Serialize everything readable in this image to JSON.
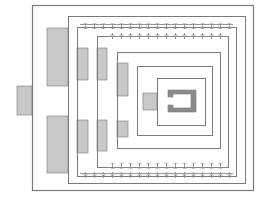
{
  "diagram": {
    "type": "architectural-floor-plan",
    "colors": {
      "background": "#ffffff",
      "line": "#7a7a7a",
      "fill_light": "#c8c8c8",
      "fill_dark": "#8a8a8a"
    },
    "enclosures": [
      {
        "x": 32,
        "y": 5,
        "w": 221,
        "h": 185
      },
      {
        "x": 68,
        "y": 16,
        "w": 177,
        "h": 167
      },
      {
        "x": 77,
        "y": 27,
        "w": 159,
        "h": 149,
        "crenellated": true
      },
      {
        "x": 97,
        "y": 36,
        "w": 131,
        "h": 131,
        "crenellated": true
      },
      {
        "x": 117,
        "y": 52,
        "w": 103,
        "h": 96
      },
      {
        "x": 137,
        "y": 66,
        "w": 75,
        "h": 69
      },
      {
        "x": 157,
        "y": 78,
        "w": 48,
        "h": 47
      }
    ],
    "gray_blocks": [
      {
        "x": 17,
        "y": 86,
        "w": 15,
        "h": 29
      },
      {
        "x": 47,
        "y": 28,
        "w": 21,
        "h": 58
      },
      {
        "x": 47,
        "y": 116,
        "w": 21,
        "h": 57
      },
      {
        "x": 77,
        "y": 48,
        "w": 11,
        "h": 32
      },
      {
        "x": 77,
        "y": 120,
        "w": 11,
        "h": 33
      },
      {
        "x": 97,
        "y": 48,
        "w": 10,
        "h": 32
      },
      {
        "x": 97,
        "y": 120,
        "w": 10,
        "h": 31
      },
      {
        "x": 117,
        "y": 63,
        "w": 11,
        "h": 33
      },
      {
        "x": 117,
        "y": 121,
        "w": 11,
        "h": 16
      },
      {
        "x": 143,
        "y": 93,
        "w": 14,
        "h": 17
      }
    ]
  }
}
